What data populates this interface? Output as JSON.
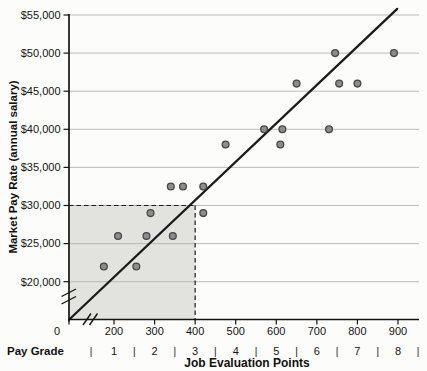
{
  "figure": {
    "xlabel": "Job Evaluation Points",
    "ylabel": "Market Pay Rate (annual salary)",
    "pay_grade_label": "Pay Grade"
  },
  "chart_data": {
    "type": "scatter",
    "title": "",
    "xlabel": "Job Evaluation Points",
    "ylabel": "Market Pay Rate (annual salary)",
    "grid": "horizontal",
    "legend": "none",
    "x_axis": {
      "origin_label": "0",
      "ticks": [
        200,
        300,
        400,
        500,
        600,
        700,
        800,
        900
      ],
      "tick_labels": [
        "200",
        "300",
        "400",
        "500",
        "600",
        "700",
        "800",
        "900"
      ],
      "break_near_origin": true,
      "range_points": [
        0,
        950
      ]
    },
    "y_axis": {
      "ticks": [
        {
          "value": 20000,
          "label": "$20,000"
        },
        {
          "value": 25000,
          "label": "$25,000"
        },
        {
          "value": 30000,
          "label": "$30,000"
        },
        {
          "value": 35000,
          "label": "$35,000"
        },
        {
          "value": 40000,
          "label": "$40,000"
        },
        {
          "value": 45000,
          "label": "$45,000"
        },
        {
          "value": 50000,
          "label": "$50,000"
        },
        {
          "value": 55000,
          "label": "$55,000"
        }
      ],
      "break_near_origin": true,
      "range_usd": [
        15000,
        55000
      ]
    },
    "pay_grade": {
      "label": "Pay Grade",
      "grades": [
        "1",
        "2",
        "3",
        "4",
        "5",
        "6",
        "7",
        "8"
      ],
      "separator": "|"
    },
    "points": [
      [
        175,
        22000
      ],
      [
        210,
        26000
      ],
      [
        255,
        22000
      ],
      [
        280,
        26000
      ],
      [
        290,
        29000
      ],
      [
        340,
        32500
      ],
      [
        345,
        26000
      ],
      [
        370,
        32500
      ],
      [
        420,
        29000
      ],
      [
        420,
        32500
      ],
      [
        475,
        38000
      ],
      [
        570,
        40000
      ],
      [
        610,
        38000
      ],
      [
        615,
        40000
      ],
      [
        650,
        46000
      ],
      [
        730,
        40000
      ],
      [
        745,
        50000
      ],
      [
        755,
        46000
      ],
      [
        800,
        46000
      ],
      [
        890,
        50000
      ]
    ],
    "trendline": {
      "p1": {
        "points": 91,
        "salary": 15100
      },
      "p2": {
        "points": 898,
        "salary": 55800
      }
    },
    "reference_region": {
      "points_max": 400,
      "salary_max": 30000,
      "description": "shaded band up to $30,000 and 400 points bounded by dashed lines"
    },
    "colors": {
      "shade": "#e2e2de",
      "gridline": "#b3b3b1",
      "point_fill": "#8b8c8d",
      "point_stroke": "#474749",
      "trendline": "#1b1b1b",
      "dashed": "#1b1b1b",
      "axis": "#141414",
      "text": "#141414"
    }
  }
}
